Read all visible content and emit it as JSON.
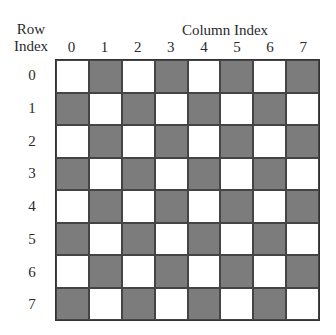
{
  "row_axis": {
    "title_line1": "Row",
    "title_line2": "Index"
  },
  "column_axis": {
    "title": "Column Index"
  },
  "column_indices": [
    "0",
    "1",
    "2",
    "3",
    "4",
    "5",
    "6",
    "7"
  ],
  "row_indices": [
    "0",
    "1",
    "2",
    "3",
    "4",
    "5",
    "6",
    "7"
  ],
  "colors": {
    "dark": "#7c7c7c",
    "light": "#ffffff",
    "border": "#333333"
  },
  "board": {
    "rows": 8,
    "cols": 8,
    "pattern": "dark where (row + col) is odd",
    "cells": [
      [
        "light",
        "dark",
        "light",
        "dark",
        "light",
        "dark",
        "light",
        "dark"
      ],
      [
        "dark",
        "light",
        "dark",
        "light",
        "dark",
        "light",
        "dark",
        "light"
      ],
      [
        "light",
        "dark",
        "light",
        "dark",
        "light",
        "dark",
        "light",
        "dark"
      ],
      [
        "dark",
        "light",
        "dark",
        "light",
        "dark",
        "light",
        "dark",
        "light"
      ],
      [
        "light",
        "dark",
        "light",
        "dark",
        "light",
        "dark",
        "light",
        "dark"
      ],
      [
        "dark",
        "light",
        "dark",
        "light",
        "dark",
        "light",
        "dark",
        "light"
      ],
      [
        "light",
        "dark",
        "light",
        "dark",
        "light",
        "dark",
        "light",
        "dark"
      ],
      [
        "dark",
        "light",
        "dark",
        "light",
        "dark",
        "light",
        "dark",
        "light"
      ]
    ]
  }
}
